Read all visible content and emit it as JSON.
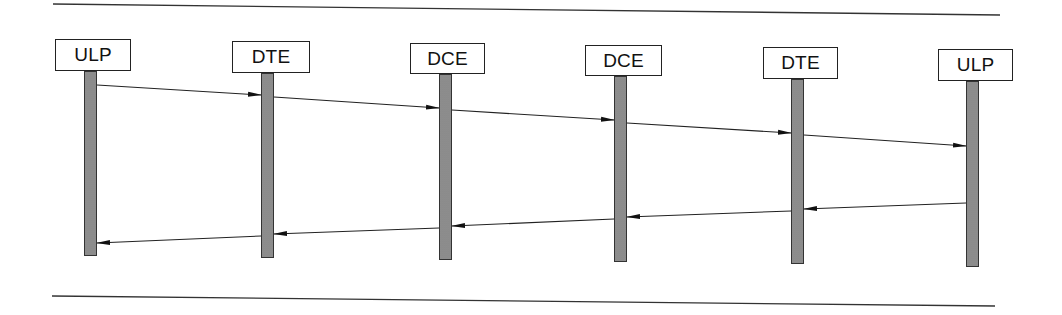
{
  "diagram": {
    "type": "sequence",
    "rules": {
      "top": {
        "x1": 53,
        "y1": 4,
        "x2": 1000,
        "y2": 15
      },
      "bottom": {
        "x1": 52,
        "y1": 296,
        "x2": 995,
        "y2": 306
      }
    },
    "entities": [
      {
        "id": "ulp1",
        "label": "ULP",
        "box": {
          "x": 55,
          "y": 39,
          "w": 76,
          "h": 32
        },
        "bar": {
          "x": 84,
          "y": 71,
          "w": 13,
          "bottom": 256
        }
      },
      {
        "id": "dte1",
        "label": "DTE",
        "box": {
          "x": 232,
          "y": 41,
          "w": 78,
          "h": 32
        },
        "bar": {
          "x": 261,
          "y": 73,
          "w": 13,
          "bottom": 258
        }
      },
      {
        "id": "dce1",
        "label": "DCE",
        "box": {
          "x": 410,
          "y": 43,
          "w": 75,
          "h": 31
        },
        "bar": {
          "x": 439,
          "y": 74,
          "w": 13,
          "bottom": 260
        }
      },
      {
        "id": "dce2",
        "label": "DCE",
        "box": {
          "x": 585,
          "y": 45,
          "w": 77,
          "h": 31
        },
        "bar": {
          "x": 614,
          "y": 76,
          "w": 13,
          "bottom": 262
        }
      },
      {
        "id": "dte2",
        "label": "DTE",
        "box": {
          "x": 763,
          "y": 47,
          "w": 75,
          "h": 32
        },
        "bar": {
          "x": 791,
          "y": 79,
          "w": 13,
          "bottom": 264
        }
      },
      {
        "id": "ulp2",
        "label": "ULP",
        "box": {
          "x": 938,
          "y": 49,
          "w": 75,
          "h": 32
        },
        "bar": {
          "x": 966,
          "y": 81,
          "w": 13,
          "bottom": 267
        }
      }
    ],
    "messages": [
      {
        "from": "ulp1",
        "to": "dte1",
        "x1": 97,
        "y1": 85,
        "x2": 261,
        "y2": 95
      },
      {
        "from": "dte1",
        "to": "dce1",
        "x1": 274,
        "y1": 97,
        "x2": 439,
        "y2": 108
      },
      {
        "from": "dce1",
        "to": "dce2",
        "x1": 452,
        "y1": 110,
        "x2": 614,
        "y2": 120
      },
      {
        "from": "dce2",
        "to": "dte2",
        "x1": 627,
        "y1": 123,
        "x2": 791,
        "y2": 133
      },
      {
        "from": "dte2",
        "to": "ulp2",
        "x1": 804,
        "y1": 135,
        "x2": 966,
        "y2": 146
      },
      {
        "from": "ulp2",
        "to": "dte2",
        "x1": 966,
        "y1": 203,
        "x2": 804,
        "y2": 209
      },
      {
        "from": "dte2",
        "to": "dce2",
        "x1": 791,
        "y1": 211,
        "x2": 627,
        "y2": 217
      },
      {
        "from": "dce2",
        "to": "dce1",
        "x1": 614,
        "y1": 219,
        "x2": 452,
        "y2": 226
      },
      {
        "from": "dce1",
        "to": "dte1",
        "x1": 439,
        "y1": 228,
        "x2": 274,
        "y2": 234
      },
      {
        "from": "dte1",
        "to": "ulp1",
        "x1": 261,
        "y1": 236,
        "x2": 97,
        "y2": 243
      }
    ],
    "colors": {
      "line": "#222222",
      "bar_fill": "#9a9a9a",
      "box_border": "#222222"
    }
  }
}
